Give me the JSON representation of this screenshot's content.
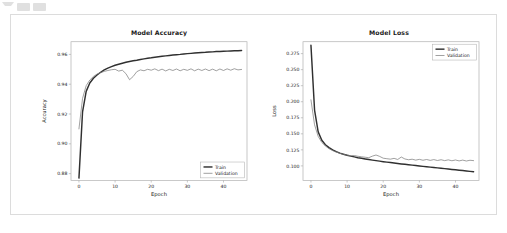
{
  "toolbar": {
    "icons": [
      "caret-down-icon",
      "toolbar-button-icon",
      "toolbar-button-icon"
    ]
  },
  "colors": {
    "train": "#303030",
    "validation": "#808080",
    "axis": "#b0b0b0",
    "text": "#1a1a1a",
    "cell_border": "#dcdcdc",
    "background": "#ffffff"
  },
  "chart_data": [
    {
      "type": "line",
      "title": "Model Accuracy",
      "xlabel": "Epoch",
      "ylabel": "Accuracy",
      "xlim": [
        -2.2,
        46.5
      ],
      "ylim": [
        0.8755,
        0.9685
      ],
      "xticks": [
        0,
        10,
        20,
        30,
        40
      ],
      "yticks": [
        0.88,
        0.9,
        0.92,
        0.94,
        0.96
      ],
      "ytick_labels": [
        "0.88",
        "0.90",
        "0.92",
        "0.94",
        "0.96"
      ],
      "xtick_labels": [
        "0",
        "10",
        "20",
        "30",
        "40"
      ],
      "grid": false,
      "legend_position": "lower right",
      "legend": [
        "Train",
        "Validation"
      ],
      "x": [
        0,
        1,
        2,
        3,
        4,
        5,
        6,
        7,
        8,
        9,
        10,
        11,
        12,
        13,
        14,
        15,
        16,
        17,
        18,
        19,
        20,
        21,
        22,
        23,
        24,
        25,
        26,
        27,
        28,
        29,
        30,
        31,
        32,
        33,
        34,
        35,
        36,
        37,
        38,
        39,
        40,
        41,
        42,
        43,
        44,
        45
      ],
      "series": [
        {
          "name": "Train",
          "values": [
            0.877,
            0.9215,
            0.9352,
            0.9408,
            0.944,
            0.9462,
            0.948,
            0.9496,
            0.9508,
            0.9518,
            0.9527,
            0.9534,
            0.9541,
            0.9547,
            0.9552,
            0.9557,
            0.9561,
            0.9566,
            0.957,
            0.9574,
            0.9577,
            0.9581,
            0.9584,
            0.9587,
            0.959,
            0.9593,
            0.9596,
            0.9598,
            0.96,
            0.9603,
            0.9605,
            0.9607,
            0.9609,
            0.9611,
            0.9613,
            0.9614,
            0.9616,
            0.9617,
            0.9619,
            0.962,
            0.9621,
            0.9622,
            0.9623,
            0.9624,
            0.9625,
            0.9626
          ]
        },
        {
          "name": "Validation",
          "values": [
            0.91,
            0.9305,
            0.939,
            0.9428,
            0.9452,
            0.9468,
            0.9478,
            0.9486,
            0.9492,
            0.9497,
            0.95,
            0.9488,
            0.9494,
            0.9471,
            0.943,
            0.9452,
            0.9484,
            0.9496,
            0.949,
            0.95,
            0.9494,
            0.9503,
            0.9491,
            0.9501,
            0.9489,
            0.95,
            0.9492,
            0.9502,
            0.949,
            0.95,
            0.9493,
            0.9503,
            0.949,
            0.9501,
            0.9492,
            0.9502,
            0.9491,
            0.9501,
            0.949,
            0.9502,
            0.9492,
            0.9503,
            0.9494,
            0.9504,
            0.9496,
            0.9499
          ]
        }
      ]
    },
    {
      "type": "line",
      "title": "Model Loss",
      "xlabel": "Epoch",
      "ylabel": "Loss",
      "xlim": [
        -2.2,
        46.5
      ],
      "ylim": [
        0.0775,
        0.2935
      ],
      "xticks": [
        0,
        10,
        20,
        30,
        40
      ],
      "yticks": [
        0.1,
        0.125,
        0.15,
        0.175,
        0.2,
        0.225,
        0.25,
        0.275
      ],
      "ytick_labels": [
        "0.100",
        "0.125",
        "0.150",
        "0.175",
        "0.200",
        "0.225",
        "0.250",
        "0.275"
      ],
      "xtick_labels": [
        "0",
        "10",
        "20",
        "30",
        "40"
      ],
      "grid": false,
      "legend_position": "upper right",
      "legend": [
        "Train",
        "Validation"
      ],
      "x": [
        0,
        1,
        2,
        3,
        4,
        5,
        6,
        7,
        8,
        9,
        10,
        11,
        12,
        13,
        14,
        15,
        16,
        17,
        18,
        19,
        20,
        21,
        22,
        23,
        24,
        25,
        26,
        27,
        28,
        29,
        30,
        31,
        32,
        33,
        34,
        35,
        36,
        37,
        38,
        39,
        40,
        41,
        42,
        43,
        44,
        45
      ],
      "series": [
        {
          "name": "Train",
          "values": [
            0.288,
            0.187,
            0.153,
            0.14,
            0.133,
            0.1285,
            0.125,
            0.1222,
            0.12,
            0.1182,
            0.1166,
            0.1152,
            0.114,
            0.1128,
            0.1118,
            0.1108,
            0.1099,
            0.109,
            0.1082,
            0.1074,
            0.1066,
            0.1059,
            0.1052,
            0.1045,
            0.1038,
            0.1031,
            0.1025,
            0.1018,
            0.1012,
            0.1005,
            0.0999,
            0.0993,
            0.0987,
            0.0981,
            0.0975,
            0.0969,
            0.0963,
            0.0957,
            0.0951,
            0.0945,
            0.0939,
            0.0933,
            0.0927,
            0.0921,
            0.0915,
            0.0909
          ]
        },
        {
          "name": "Validation",
          "values": [
            0.203,
            0.164,
            0.146,
            0.1365,
            0.131,
            0.1268,
            0.1238,
            0.1215,
            0.1196,
            0.118,
            0.1168,
            0.1158,
            0.1162,
            0.115,
            0.1142,
            0.1135,
            0.1128,
            0.1152,
            0.117,
            0.1148,
            0.112,
            0.1112,
            0.1105,
            0.1118,
            0.11,
            0.1138,
            0.1108,
            0.1096,
            0.1104,
            0.109,
            0.1102,
            0.1088,
            0.11,
            0.1086,
            0.1098,
            0.1084,
            0.1096,
            0.1082,
            0.1094,
            0.108,
            0.1092,
            0.1078,
            0.109,
            0.1076,
            0.1088,
            0.1082
          ]
        }
      ]
    }
  ]
}
